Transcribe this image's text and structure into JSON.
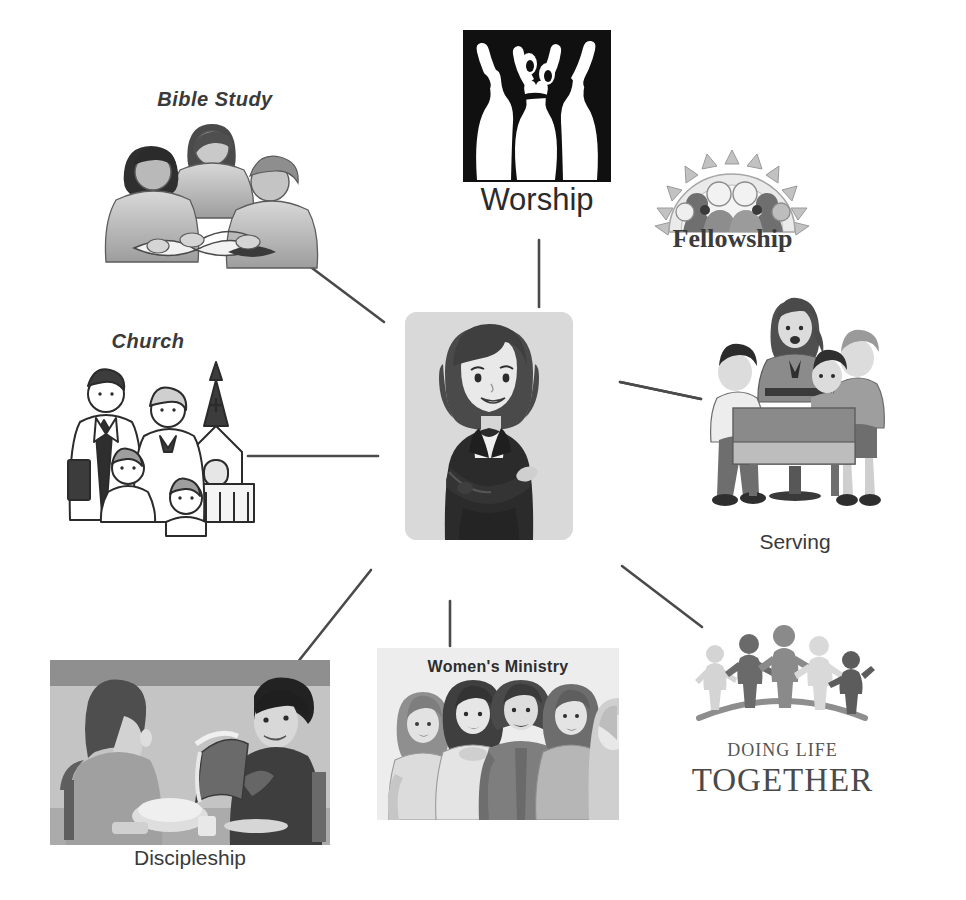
{
  "diagram": {
    "center": {
      "name": "center-figure",
      "alt_label": "woman with crossed arms",
      "plate_color": "#d9d9d9"
    },
    "nodes": [
      {
        "id": "bible-study",
        "label": "Bible Study",
        "label_style": "italic-bold",
        "icon": "three-people-studying-illustration"
      },
      {
        "id": "worship",
        "label": "Worship",
        "label_style": "plain",
        "icon": "worship-raised-arms-logo"
      },
      {
        "id": "fellowship",
        "label": "Fellowship",
        "label_style": "serif-bold",
        "icon": "fellowship-sunburst-group-logo"
      },
      {
        "id": "church",
        "label": "Church",
        "label_style": "italic-bold",
        "icon": "family-with-church-steeple-lineart"
      },
      {
        "id": "serving",
        "label": "Serving",
        "label_style": "plain",
        "icon": "woman-serving-children-at-table"
      },
      {
        "id": "discipleship",
        "label": "Discipleship",
        "label_style": "plain",
        "icon": "two-people-reading-book-photo"
      },
      {
        "id": "womens",
        "label": "Women's Ministry",
        "label_style": "bold",
        "icon": "group-of-women-photo"
      },
      {
        "id": "dlt",
        "label_top": "DOING LIFE",
        "label_bottom": "TOGETHER",
        "label_style": "serif",
        "icon": "five-figures-holding-hands-logo"
      }
    ],
    "connectors": [
      {
        "from": "center",
        "to": "bible-study",
        "shape": "diagonal"
      },
      {
        "from": "center",
        "to": "worship",
        "shape": "vertical"
      },
      {
        "from": "center",
        "to": "fellowship",
        "shape": "diagonal"
      },
      {
        "from": "center",
        "to": "church",
        "shape": "horizontal"
      },
      {
        "from": "center",
        "to": "serving",
        "shape": "diagonal"
      },
      {
        "from": "center",
        "to": "discipleship",
        "shape": "diagonal"
      },
      {
        "from": "center",
        "to": "womens",
        "shape": "vertical"
      },
      {
        "from": "center",
        "to": "dlt",
        "shape": "diagonal"
      }
    ]
  },
  "colors": {
    "background": "#ffffff",
    "line": "#4a4a4a",
    "text": "#3a3a3a",
    "worship_mark": "#101010",
    "center_plate": "#d9d9d9",
    "photo_gray": "#b9b9b9"
  }
}
